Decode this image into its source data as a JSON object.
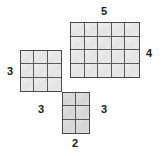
{
  "figure": {
    "type": "polyomino-net-diagram",
    "colors": {
      "cell_fill": "#e8e8e8",
      "cell_shaded_fill": "#dcdcdc",
      "grid_line": "#5a5a5a",
      "outline": "#4a4a4a",
      "label_text": "#1a1a1a",
      "background": "#ffffff"
    },
    "blocks": [
      {
        "name": "top-right-block",
        "columns": 5,
        "rows": 4
      },
      {
        "name": "left-block",
        "columns": 3,
        "rows": 3
      },
      {
        "name": "bottom-block",
        "columns": 2,
        "rows": 3
      }
    ],
    "labels": {
      "top": "5",
      "right": "4",
      "left": "3",
      "bottom_left": "3",
      "bottom_right": "3",
      "bottom": "2"
    }
  }
}
